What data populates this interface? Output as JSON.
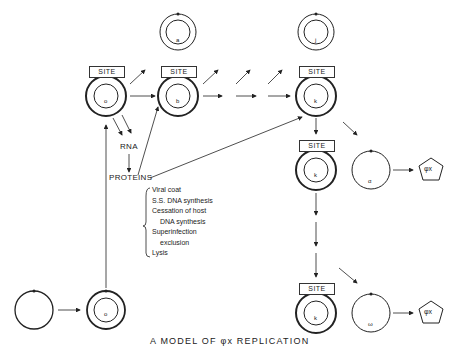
{
  "title": "A MODEL OF φx REPLICATION",
  "site_label": "SITE",
  "nodes": {
    "top_a": "a",
    "top_j": "j",
    "row_a": "o",
    "row_b": "b",
    "row_k": "k",
    "mid_k": "k",
    "bot_k": "k",
    "alpha": "α",
    "omega": "ω",
    "start_o": "o"
  },
  "labels": {
    "rna": "RNA",
    "proteins": "PROTEINS",
    "phage1": "φx",
    "phage2": "φx"
  },
  "protein_functions": [
    "Viral coat",
    "S.S. DNA synthesis",
    "Cessation of host",
    "DNA synthesis",
    "Superinfection",
    "exclusion",
    "Lysis"
  ]
}
